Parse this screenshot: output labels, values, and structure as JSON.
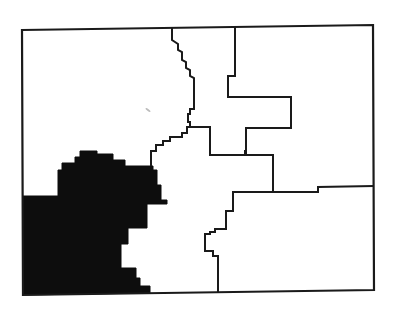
{
  "map": {
    "type": "choropleth-outline",
    "background": "#ffffff",
    "line_color": "#1a1a1a",
    "highlight_color": "#0d0d0d",
    "regions": [
      {
        "id": "west-highlighted",
        "filled": true
      },
      {
        "id": "north-central",
        "filled": false
      },
      {
        "id": "northeast",
        "filled": false
      },
      {
        "id": "central",
        "filled": false
      },
      {
        "id": "east",
        "filled": false
      },
      {
        "id": "south",
        "filled": false
      },
      {
        "id": "northwest",
        "filled": false
      }
    ],
    "highlighted_region_count": 1,
    "labels": []
  }
}
